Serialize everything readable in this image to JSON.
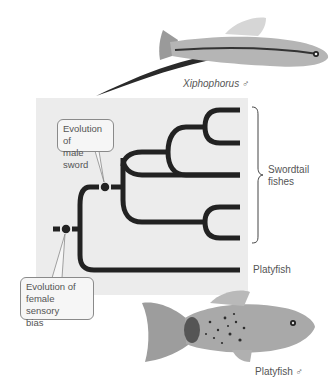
{
  "figure": {
    "top_fish": {
      "species": "Xiphophorus",
      "sex_symbol": "♂",
      "label": "Xiphophorus ♂"
    },
    "bottom_fish": {
      "species": "Platyfish",
      "sex_symbol": "♂",
      "label": "Platyfish ♂"
    },
    "callouts": {
      "male_sword": {
        "line1": "Evolution of",
        "line2": "male sword"
      },
      "female_bias": {
        "line1": "Evolution of",
        "line2": "female sensory",
        "line3": "bias"
      }
    },
    "tree": {
      "leaves": [
        "Swordtail 1",
        "Swordtail 2",
        "Swordtail 3",
        "Swordtail 4",
        "Swordtail 5",
        "Platyfish"
      ],
      "group_label": {
        "line1": "Swordtail",
        "line2": "fishes"
      },
      "outgroup_label": "Platyfish"
    },
    "colors": {
      "panel": "#ececec",
      "branch": "#222222",
      "text": "#555555"
    }
  }
}
